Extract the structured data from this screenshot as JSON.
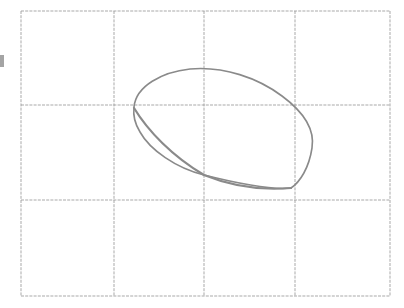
{
  "figure": {
    "canvas": {
      "width": 404,
      "height": 308,
      "background": "#ffffff"
    }
  },
  "grid": {
    "name": "grid",
    "columns": 4,
    "rows": 3,
    "bounds": {
      "left": 21,
      "top": 11,
      "right": 390,
      "bottom": 296
    },
    "vertical_lines": [
      21,
      114,
      204,
      295,
      390
    ],
    "horizontal_lines": [
      11,
      105,
      200,
      296
    ],
    "stroke_color": "#9a9a9a",
    "stroke_width": 1,
    "dash_pattern": "3 1.2",
    "opacity": 0.85
  },
  "curve": {
    "name": "closed-curve",
    "shape": "teardrop",
    "closed": true,
    "stroke_color": "#8a8a8a",
    "stroke_width": 1.6,
    "stroke_width_heavy": 2.2,
    "path": "M 134 107 C 136 86, 162 72, 190 69 C 224 66, 258 78, 282 96 C 305 113, 315 130, 312 148 C 309 168, 300 182, 291 188 C 275 190, 240 184, 204 175 C 176 168, 150 150, 140 132 C 135 124, 133 115, 134 107 Z",
    "lower_edge_path": "M 134 108 C 148 131, 172 156, 204 175 C 236 188, 268 190, 291 188",
    "key_points": {
      "apex_top": [
        205,
        69
      ],
      "leftmost": [
        134,
        107
      ],
      "rightmost": [
        312,
        148
      ],
      "bottom_cusp": [
        291,
        188
      ],
      "crosses_vertical_204_lower": [
        204,
        175
      ]
    }
  },
  "artifacts": [
    {
      "name": "left-edge-mark",
      "x": 0,
      "y": 55,
      "width": 4,
      "height": 12,
      "color": "#5a5a5a",
      "note": "faint cropped mark at the far-left image border"
    }
  ]
}
